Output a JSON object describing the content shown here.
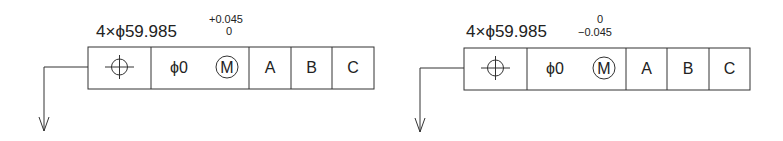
{
  "callouts": [
    {
      "id": "left",
      "size_label": "4×ϕ59.985",
      "tolerance_upper": "+0.045",
      "tolerance_lower": "0",
      "frame": {
        "symbol": "position-icon",
        "tolerance_value": "ϕ0",
        "modifier": "M",
        "datums": [
          "A",
          "B",
          "C"
        ]
      }
    },
    {
      "id": "right",
      "size_label": "4×ϕ59.985",
      "tolerance_upper": "0",
      "tolerance_lower": "−0.045",
      "frame": {
        "symbol": "position-icon",
        "tolerance_value": "ϕ0",
        "modifier": "M",
        "datums": [
          "A",
          "B",
          "C"
        ]
      }
    }
  ]
}
